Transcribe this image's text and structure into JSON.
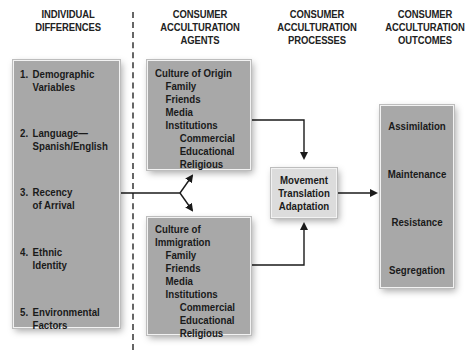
{
  "headers": {
    "individual_differences": [
      "INDIVIDUAL",
      "DIFFERENCES"
    ],
    "agents": [
      "CONSUMER",
      "ACCULTURATION",
      "AGENTS"
    ],
    "processes": [
      "CONSUMER",
      "ACCULTURATION",
      "PROCESSES"
    ],
    "outcomes": [
      "CONSUMER",
      "ACCULTURATION",
      "OUTCOMES"
    ]
  },
  "individual_differences": [
    {
      "num": "1.",
      "lines": [
        "Demographic",
        "Variables"
      ]
    },
    {
      "num": "2.",
      "lines": [
        "Language—",
        "Spanish/English"
      ]
    },
    {
      "num": "3.",
      "lines": [
        "Recency",
        "of Arrival"
      ]
    },
    {
      "num": "4.",
      "lines": [
        "Ethnic",
        "Identity"
      ]
    },
    {
      "num": "5.",
      "lines": [
        "Environmental",
        "Factors"
      ]
    }
  ],
  "culture_of_origin": {
    "title": [
      "Culture of Origin"
    ],
    "items": [
      "Family",
      "Friends",
      "Media",
      "Institutions"
    ],
    "institutions": [
      "Commercial",
      "Educational",
      "Religious"
    ]
  },
  "culture_of_immigration": {
    "title": [
      "Culture of",
      "Immigration"
    ],
    "items": [
      "Family",
      "Friends",
      "Media",
      "Institutions"
    ],
    "institutions": [
      "Commercial",
      "Educational",
      "Religious"
    ]
  },
  "processes": [
    "Movement",
    "Translation",
    "Adaptation"
  ],
  "outcomes": [
    "Assimilation",
    "Maintenance",
    "Resistance",
    "Segregation"
  ],
  "colors": {
    "box_fill": "#a8a8a8",
    "process_fill": "#dcdcdc",
    "line": "#1a1a1a",
    "divider": "#666666"
  }
}
